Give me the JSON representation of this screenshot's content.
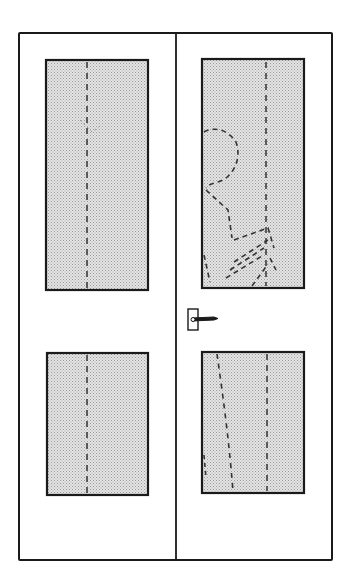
{
  "diagram": {
    "colors": {
      "background": "#ffffff",
      "line": "#1a1a1a",
      "glass_fill": "#d9d9d9",
      "glass_dot": "#9a9a9a"
    },
    "frame": {
      "x": 19,
      "y": 33,
      "width": 313,
      "height": 527
    },
    "divider_x": 176,
    "doors": [
      {
        "name": "left-door",
        "panels": [
          {
            "name": "left-top-glass",
            "x": 46,
            "y": 60,
            "width": 102,
            "height": 230
          },
          {
            "name": "left-bottom-glass",
            "x": 47,
            "y": 353,
            "width": 101,
            "height": 142
          }
        ]
      },
      {
        "name": "right-door",
        "panels": [
          {
            "name": "right-top-glass",
            "x": 202,
            "y": 59,
            "width": 102,
            "height": 229
          },
          {
            "name": "right-bottom-glass",
            "x": 202,
            "y": 352,
            "width": 102,
            "height": 141
          }
        ]
      }
    ],
    "handle": {
      "x": 188,
      "y": 310
    }
  }
}
